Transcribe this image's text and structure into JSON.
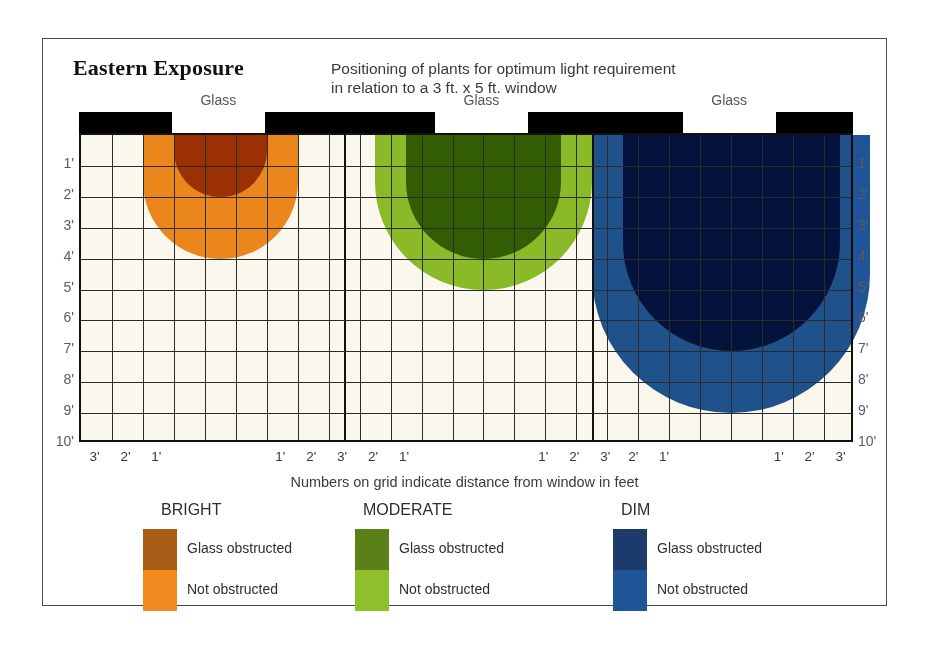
{
  "header": {
    "title": "Eastern Exposure",
    "subtitle_line1": "Positioning of plants for optimum light requirement",
    "subtitle_line2": "in relation to a 3 ft. x 5 ft. window"
  },
  "grid": {
    "glass_label": "Glass",
    "axis_note": "Numbers on grid indicate distance from window in feet",
    "y_labels": [
      "1'",
      "2'",
      "3'",
      "4'",
      "5'",
      "6'",
      "7'",
      "8'",
      "9'",
      "10'"
    ],
    "x_labels_left_group": [
      "3'",
      "2'",
      "1'"
    ],
    "x_labels_mid_group_a": [
      "1'",
      "2'",
      "3'"
    ],
    "x_labels_mid_group_b": [
      "2'",
      "1'"
    ],
    "x_labels_mid_group_c": [
      "1'",
      "2'",
      "3'"
    ],
    "x_labels_mid_group_d": [
      "2'",
      "1'"
    ],
    "x_labels_right_group": [
      "1'",
      "2'",
      "3'"
    ],
    "rows": 10,
    "cols": 25,
    "background_color": "#faf8ec",
    "line_color": "#2b2b2b",
    "wall_color": "#000000"
  },
  "legend": [
    {
      "name": "BRIGHT",
      "obstructed_label": "Glass obstructed",
      "not_obstructed_label": "Not obstructed",
      "obstructed_color": "#A85C14",
      "not_obstructed_color": "#F08A1E"
    },
    {
      "name": "MODERATE",
      "obstructed_label": "Glass obstructed",
      "not_obstructed_label": "Not obstructed",
      "obstructed_color": "#5C8018",
      "not_obstructed_color": "#8DC02A"
    },
    {
      "name": "DIM",
      "obstructed_label": "Glass obstructed",
      "not_obstructed_label": "Not obstructed",
      "obstructed_color": "#1C3B6C",
      "not_obstructed_color": "#1F5496"
    }
  ],
  "chart_data": {
    "type": "diagram",
    "title": "Eastern Exposure",
    "subtitle": "Positioning of plants for optimum light requirement in relation to a 3 ft. x 5 ft. window",
    "xlabel": "Numbers on grid indicate distance from window in feet",
    "ylabel": "Distance from window (feet)",
    "ylim": [
      0,
      10
    ],
    "grid": true,
    "legend_position": "bottom",
    "note": "Three window panels; each shows a dome of light penetration into the room. Grid squares are 1 ft.",
    "panels": [
      {
        "light_level": "BRIGHT",
        "window_width_ft": 3,
        "not_obstructed_depth_ft": 4,
        "not_obstructed_half_width_ft": 2.5,
        "glass_obstructed_depth_ft": 2,
        "glass_obstructed_half_width_ft": 1.5,
        "colors": {
          "not_obstructed": "#F08A1E",
          "glass_obstructed": "#A85C14"
        }
      },
      {
        "light_level": "MODERATE",
        "window_width_ft": 3,
        "not_obstructed_depth_ft": 5,
        "not_obstructed_half_width_ft": 3.5,
        "glass_obstructed_depth_ft": 4,
        "glass_obstructed_half_width_ft": 2.5,
        "colors": {
          "not_obstructed": "#8DC02A",
          "glass_obstructed": "#5C8018"
        }
      },
      {
        "light_level": "DIM",
        "window_width_ft": 3,
        "not_obstructed_depth_ft": 9,
        "not_obstructed_half_width_ft": 4.5,
        "glass_obstructed_depth_ft": 7,
        "glass_obstructed_half_width_ft": 3.5,
        "colors": {
          "not_obstructed": "#1F5496",
          "glass_obstructed": "#1C3B6C"
        }
      }
    ]
  }
}
